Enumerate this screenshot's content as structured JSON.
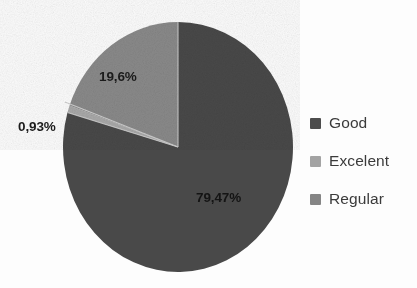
{
  "chart_data": {
    "type": "pie",
    "title": "",
    "subtitle": "",
    "xlabel": "",
    "ylabel": "",
    "grid": false,
    "legend_position": "right",
    "decimal_separator": ",",
    "categories": [
      "Good",
      "Excelent",
      "Regular"
    ],
    "values": [
      79.47,
      0.93,
      19.6
    ],
    "value_labels": [
      "79,47%",
      "0,93%",
      "19,6%"
    ],
    "colors": [
      "#4a4a4a",
      "#a9a9a9",
      "#8a8a8a"
    ],
    "start_angle_deg": 0,
    "direction": "clockwise",
    "slices": [
      {
        "name": "Good",
        "value": 79.47,
        "label": "79,47%",
        "color": "#4a4a4a",
        "start_deg": 0,
        "end_deg": 286.09
      },
      {
        "name": "Excelent",
        "value": 0.93,
        "label": "0,93%",
        "color": "#a9a9a9",
        "start_deg": 286.09,
        "end_deg": 289.44
      },
      {
        "name": "Regular",
        "value": 19.6,
        "label": "19,6%",
        "color": "#8a8a8a",
        "start_deg": 289.44,
        "end_deg": 360
      }
    ]
  },
  "chart": {
    "labels": {
      "good": "79,47%",
      "excelent": "0,93%",
      "regular": "19,6%"
    }
  },
  "legend": {
    "items": [
      {
        "label": "Good",
        "color": "#4d4d4d"
      },
      {
        "label": "Excelent",
        "color": "#a3a3a3"
      },
      {
        "label": "Regular",
        "color": "#858585"
      }
    ]
  }
}
